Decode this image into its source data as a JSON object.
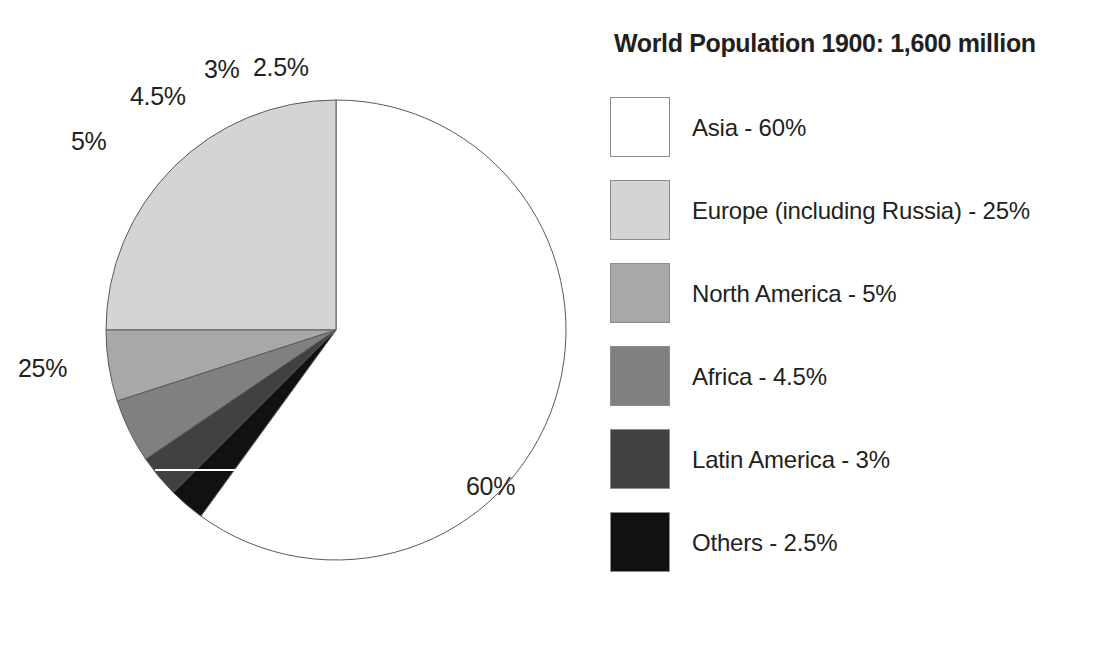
{
  "chart_data": {
    "type": "pie",
    "title": "World Population 1900: 1,600 million",
    "total_label": "1,600 million",
    "year": "1900",
    "unit": "million",
    "total_value": 1600,
    "categories": [
      "Asia",
      "Europe (including Russia)",
      "North America",
      "Africa",
      "Latin America",
      "Others"
    ],
    "values": [
      60,
      25,
      5,
      4.5,
      3,
      2.5
    ],
    "value_unit": "percent",
    "legend_position": "right",
    "grid": false,
    "start_angle_deg": 0,
    "slices": [
      {
        "name": "Asia",
        "value": 60,
        "percent_label": "60%",
        "color": "#ffffff",
        "direction": "clockwise"
      },
      {
        "name": "Europe (including Russia)",
        "value": 25,
        "percent_label": "25%",
        "color": "#d4d4d2",
        "direction": "counter-clockwise"
      },
      {
        "name": "North America",
        "value": 5,
        "percent_label": "5%",
        "color": "#a8a8a6",
        "direction": "counter-clockwise"
      },
      {
        "name": "Africa",
        "value": 4.5,
        "percent_label": "4.5%",
        "color": "#808080",
        "direction": "counter-clockwise"
      },
      {
        "name": "Latin America",
        "value": 3,
        "percent_label": "3%",
        "color": "#414042",
        "direction": "counter-clockwise"
      },
      {
        "name": "Others",
        "value": 2.5,
        "percent_label": "2.5%",
        "color": "#111111",
        "direction": "counter-clockwise"
      }
    ],
    "legend": [
      {
        "label": "Asia - 60%",
        "swatch_color": "#ffffff"
      },
      {
        "label": "Europe (including Russia) - 25%",
        "swatch_color": "#d4d4d2"
      },
      {
        "label": "North America - 5%",
        "swatch_color": "#a8a8a6"
      },
      {
        "label": "Africa - 4.5%",
        "swatch_color": "#808080"
      },
      {
        "label": "Latin America - 3%",
        "swatch_color": "#414042"
      },
      {
        "label": "Others - 2.5%",
        "swatch_color": "#111111"
      }
    ],
    "callout_labels": [
      {
        "text": "60%",
        "for": "Asia"
      },
      {
        "text": "25%",
        "for": "Europe (including Russia)"
      },
      {
        "text": "5%",
        "for": "North America"
      },
      {
        "text": "4.5%",
        "for": "Africa"
      },
      {
        "text": "3%",
        "for": "Latin America"
      },
      {
        "text": "2.5%",
        "for": "Others"
      }
    ]
  },
  "colors": {
    "outline": "#5a5a5a",
    "text": "#231f20",
    "background": "#ffffff"
  }
}
